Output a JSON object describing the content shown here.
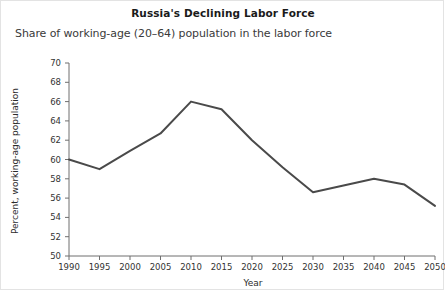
{
  "chart_data": {
    "type": "line",
    "title": "Russia's Declining Labor Force",
    "subtitle": "Share of working-age (20–64) population in the labor force",
    "xlabel": "Year",
    "ylabel": "Percent, working-age population",
    "x": [
      1990,
      1995,
      2000,
      2005,
      2010,
      2015,
      2020,
      2025,
      2030,
      2035,
      2040,
      2045,
      2050
    ],
    "values": [
      60.0,
      59.0,
      60.9,
      62.7,
      66.0,
      65.2,
      62.0,
      59.2,
      56.6,
      57.3,
      58.0,
      57.4,
      55.2
    ],
    "xtick_labels": [
      "1990",
      "1995",
      "2000",
      "2005",
      "2010",
      "2015",
      "2020",
      "2025",
      "2030",
      "2035",
      "2040",
      "2045",
      "2050"
    ],
    "ytick_labels": [
      "50",
      "52",
      "54",
      "56",
      "58",
      "60",
      "62",
      "64",
      "66",
      "68",
      "70"
    ],
    "ytick_values": [
      50,
      52,
      54,
      56,
      58,
      60,
      62,
      64,
      66,
      68,
      70
    ],
    "xlim": [
      1990,
      2050
    ],
    "ylim": [
      50,
      70
    ],
    "grid": false,
    "legend": false,
    "series_color": "#4a4a4a",
    "axis_color": "#6f6f6f",
    "background_color": "#ffffff"
  }
}
